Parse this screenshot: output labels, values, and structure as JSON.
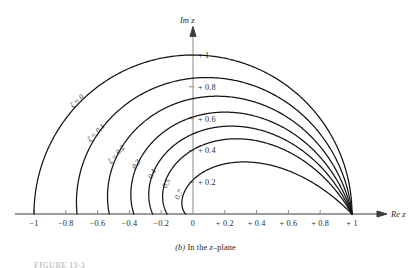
{
  "figure": {
    "caption_prefix": "(b)",
    "caption_text": "In the",
    "caption_var": "z",
    "caption_suffix": "–plane",
    "figure_number": "FIGURE 13-3",
    "background_color": "#ffffff",
    "curve_color": "#141414",
    "axis_color": "#3b3b3b"
  },
  "axes": {
    "x_title": "Re z",
    "y_title": "Im z",
    "x_ticks": [
      {
        "label": "−1",
        "value": -1
      },
      {
        "label": "−0.8",
        "value": -0.8
      },
      {
        "label": "−0.6",
        "value": -0.6
      },
      {
        "label": "−0.4",
        "value": -0.4
      },
      {
        "label": "−0.2",
        "value": -0.2
      },
      {
        "label": "0",
        "value": 0
      },
      {
        "label": "+ 0.2",
        "value": 0.2
      },
      {
        "label": "+ 0.4",
        "value": 0.4
      },
      {
        "label": "+ 0.6",
        "value": 0.6
      },
      {
        "label": "+ 0.8",
        "value": 0.8
      },
      {
        "label": "+ 1",
        "value": 1
      }
    ],
    "y_ticks": [
      {
        "label": "+ 0.2",
        "value": 0.2
      },
      {
        "label": "+ 0.4",
        "value": 0.4
      },
      {
        "label": "+ 0.6",
        "value": 0.6
      },
      {
        "label": "+ 0.8",
        "value": 0.8
      },
      {
        "label": "+ 1",
        "value": 1
      }
    ],
    "xlim": [
      -1.12,
      1.22
    ],
    "ylim": [
      0,
      1.18
    ]
  },
  "chart_data": {
    "type": "line",
    "xlabel": "Re z",
    "ylabel": "Im z",
    "xlim": [
      -1.12,
      1.22
    ],
    "ylim": [
      0,
      1.18
    ],
    "grid": false,
    "legend": "inline-curve-labels",
    "series": [
      {
        "name": "ζ = 0",
        "zeta": 0,
        "label_text": "ζ = 0",
        "label_x": -0.72,
        "label_y": 0.7,
        "label_rotation": -42,
        "real_axis_crossing": -1.0
      },
      {
        "name": "ζ = 0.1",
        "zeta": 0.1,
        "label_text": "ζ = 0.1",
        "label_x": -0.6,
        "label_y": 0.5,
        "label_rotation": -46,
        "real_axis_crossing": -0.73
      },
      {
        "name": "ζ = 0.2",
        "zeta": 0.2,
        "label_text": "ζ = 0.2",
        "label_x": -0.47,
        "label_y": 0.365,
        "label_rotation": -50,
        "real_axis_crossing": -0.53
      },
      {
        "name": "0.3",
        "zeta": 0.3,
        "label_text": "0.3",
        "label_x": -0.345,
        "label_y": 0.305,
        "label_rotation": -56,
        "real_axis_crossing": -0.37
      },
      {
        "name": "0.4",
        "zeta": 0.4,
        "label_text": "0.4",
        "label_x": -0.245,
        "label_y": 0.245,
        "label_rotation": -60,
        "real_axis_crossing": -0.26
      },
      {
        "name": "0.5",
        "zeta": 0.5,
        "label_text": "0.5",
        "label_x": -0.155,
        "label_y": 0.185,
        "label_rotation": -63,
        "real_axis_crossing": -0.163
      },
      {
        "name": "0.7",
        "zeta": 0.7,
        "label_text": "0.7",
        "label_x": -0.075,
        "label_y": 0.115,
        "label_rotation": -66,
        "real_axis_crossing": -0.046
      }
    ]
  }
}
